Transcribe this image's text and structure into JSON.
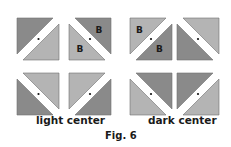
{
  "figure": {
    "caption": "Fig. 6",
    "colors": {
      "dark": "#8a8a8a",
      "light": "#b4b4b4",
      "edge": "#6e6e6e",
      "gap": "#ffffff",
      "dot": "#111111"
    },
    "groups": [
      {
        "label": "light center",
        "squares": [
          {
            "position": "top-left",
            "diagonal": "/",
            "dark_half": "top-left",
            "light_half": "bottom-right",
            "letters": []
          },
          {
            "position": "top-right",
            "diagonal": "\\",
            "dark_half": "top-right",
            "light_half": "bottom-left",
            "letters": [
              "B",
              "B"
            ]
          },
          {
            "position": "bottom-left",
            "diagonal": "\\",
            "dark_half": "bottom-left",
            "light_half": "top-right",
            "letters": []
          },
          {
            "position": "bottom-right",
            "diagonal": "/",
            "dark_half": "bottom-right",
            "light_half": "top-left",
            "letters": []
          }
        ]
      },
      {
        "label": "dark center",
        "squares": [
          {
            "position": "top-left",
            "diagonal": "/",
            "dark_half": "bottom-right",
            "light_half": "top-left",
            "letters": [
              "B",
              "B"
            ]
          },
          {
            "position": "top-right",
            "diagonal": "\\",
            "dark_half": "bottom-left",
            "light_half": "top-right",
            "letters": []
          },
          {
            "position": "bottom-left",
            "diagonal": "\\",
            "dark_half": "top-right",
            "light_half": "bottom-left",
            "letters": []
          },
          {
            "position": "bottom-right",
            "diagonal": "/",
            "dark_half": "top-left",
            "light_half": "bottom-right",
            "letters": []
          }
        ]
      }
    ],
    "letter": "B"
  }
}
